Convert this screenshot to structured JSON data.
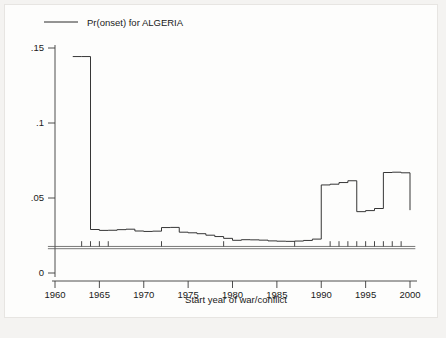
{
  "figure": {
    "background_color": "#fdfdfc",
    "page_color": "#f4f3f1",
    "line_color": "#2b2b2b",
    "axis_color": "#3a3a3a"
  },
  "legend": {
    "position": "top-left",
    "entries": [
      {
        "label": "Pr(onset) for ALGERIA",
        "icon": "line-swatch"
      }
    ]
  },
  "axes": {
    "x": {
      "label": "Start year of war/conflict",
      "ticks": [
        1960,
        1965,
        1970,
        1975,
        1980,
        1985,
        1990,
        1995,
        2000
      ],
      "tick_labels": [
        "1960",
        "1965",
        "1970",
        "1975",
        "1980",
        "1985",
        "1990",
        "1995",
        "2000"
      ],
      "range": [
        1959.2,
        2001.0
      ]
    },
    "y": {
      "label": "",
      "ticks": [
        0,
        0.05,
        0.1,
        0.15
      ],
      "tick_labels": [
        "0",
        ".05",
        ".1",
        ".15"
      ],
      "range": [
        -0.004,
        0.158
      ]
    },
    "grid": false
  },
  "chart_data": {
    "type": "line",
    "subtype": "step-post",
    "title": "",
    "subtitle": "",
    "xlabel": "Start year of war/conflict",
    "ylabel": "",
    "xlim": [
      1959.2,
      2001.0
    ],
    "ylim": [
      -0.004,
      0.158
    ],
    "grid": false,
    "legend_position": "top-left",
    "series": [
      {
        "name": "Pr(onset) for ALGERIA",
        "style": "step",
        "x": [
          1962,
          1963,
          1964,
          1965,
          1966,
          1967,
          1968,
          1969,
          1970,
          1971,
          1972,
          1973,
          1974,
          1975,
          1976,
          1977,
          1978,
          1979,
          1980,
          1981,
          1982,
          1983,
          1984,
          1985,
          1986,
          1987,
          1988,
          1989,
          1990,
          1991,
          1992,
          1993,
          1994,
          1995,
          1996,
          1997,
          1998,
          1999
        ],
        "values": [
          0.1443,
          0.1443,
          0.029,
          0.0284,
          0.0285,
          0.0289,
          0.0292,
          0.028,
          0.0277,
          0.0279,
          0.0303,
          0.0304,
          0.0272,
          0.0268,
          0.0262,
          0.0252,
          0.0243,
          0.0231,
          0.0218,
          0.0222,
          0.0221,
          0.0219,
          0.0214,
          0.0212,
          0.0211,
          0.0213,
          0.0217,
          0.0226,
          0.0587,
          0.0592,
          0.0603,
          0.0615,
          0.0409,
          0.0416,
          0.043,
          0.067,
          0.0672,
          0.0668
        ],
        "final_drop_to": 0.0419
      },
      {
        "name": "baseline-rule",
        "style": "horizontal-rule-pair",
        "values": [
          0.0177,
          0.0162
        ],
        "x_from": 1959.2,
        "x_to": 2000.6
      }
    ],
    "rug": {
      "name": "event-spikes",
      "y_base": 0.0177,
      "height": 0.0035,
      "x": [
        1963,
        1964,
        1965,
        1966,
        1972,
        1979,
        1987,
        1991,
        1992,
        1993,
        1994,
        1995,
        1996,
        1997,
        1998,
        1999
      ]
    }
  }
}
